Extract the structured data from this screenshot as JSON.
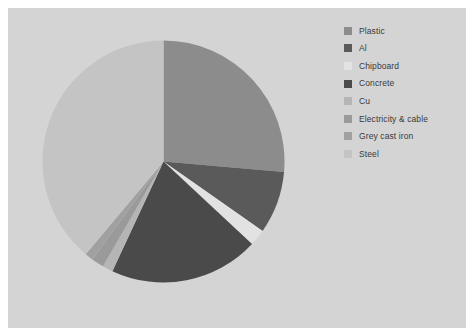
{
  "panel": {
    "background_color": "#d4d4d4"
  },
  "legend": {
    "position": "right",
    "items": [
      {
        "label": "Plastic",
        "color": "#8c8c8c"
      },
      {
        "label": "Al",
        "color": "#5a5a5a"
      },
      {
        "label": "Chipboard",
        "color": "#e2e2e2"
      },
      {
        "label": "Concrete",
        "color": "#4a4a4a"
      },
      {
        "label": "Cu",
        "color": "#b5b5b5"
      },
      {
        "label": "Electricity & cable",
        "color": "#9a9a9a"
      },
      {
        "label": "Grey cast iron",
        "color": "#a0a0a0"
      },
      {
        "label": "Steel",
        "color": "#c4c4c4"
      }
    ]
  },
  "chart_data": {
    "type": "pie",
    "title": "",
    "start_angle_deg": 0,
    "direction": "clockwise",
    "center": {
      "x": 121.5,
      "y": 121.5
    },
    "radius": 121,
    "categories": [
      "Plastic",
      "Al",
      "Chipboard",
      "Concrete",
      "Cu",
      "Electricity & cable",
      "Grey cast iron",
      "Steel"
    ],
    "values": [
      26.4,
      8.3,
      2.2,
      20.0,
      1.4,
      1.7,
      1.1,
      38.9
    ],
    "unit": "%",
    "colors": [
      "#8c8c8c",
      "#5a5a5a",
      "#e2e2e2",
      "#4a4a4a",
      "#b5b5b5",
      "#9a9a9a",
      "#a0a0a0",
      "#c4c4c4"
    ],
    "slices": [
      {
        "label": "Plastic",
        "value": 26.4,
        "start_deg": 0.0,
        "end_deg": 95.0,
        "color": "#8c8c8c"
      },
      {
        "label": "Al",
        "value": 8.3,
        "start_deg": 95.0,
        "end_deg": 125.0,
        "color": "#5a5a5a"
      },
      {
        "label": "Chipboard",
        "value": 2.2,
        "start_deg": 125.0,
        "end_deg": 133.0,
        "color": "#e2e2e2"
      },
      {
        "label": "Concrete",
        "value": 20.0,
        "start_deg": 133.0,
        "end_deg": 205.0,
        "color": "#4a4a4a"
      },
      {
        "label": "Cu",
        "value": 1.4,
        "start_deg": 205.0,
        "end_deg": 210.0,
        "color": "#b5b5b5"
      },
      {
        "label": "Electricity & cable",
        "value": 1.7,
        "start_deg": 210.0,
        "end_deg": 216.0,
        "color": "#9a9a9a"
      },
      {
        "label": "Grey cast iron",
        "value": 1.1,
        "start_deg": 216.0,
        "end_deg": 220.0,
        "color": "#a0a0a0"
      },
      {
        "label": "Steel",
        "value": 38.9,
        "start_deg": 220.0,
        "end_deg": 360.0,
        "color": "#c4c4c4"
      }
    ],
    "legend_entries": [
      "Plastic",
      "Al",
      "Chipboard",
      "Concrete",
      "Cu",
      "Electricity & cable",
      "Grey cast iron",
      "Steel"
    ],
    "grid": false,
    "xlabel": "",
    "ylabel": ""
  }
}
